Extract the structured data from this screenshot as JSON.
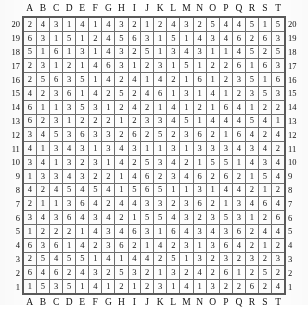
{
  "table": {
    "type": "grid",
    "description": "20 by 20 numeric lookup grid with letter column headers A-T repeated top and bottom, and row numbers 20 down to 1 repeated on left and right edges.",
    "column_headers": [
      "A",
      "B",
      "C",
      "D",
      "E",
      "F",
      "G",
      "H",
      "I",
      "J",
      "K",
      "L",
      "M",
      "N",
      "O",
      "P",
      "Q",
      "R",
      "S",
      "T"
    ],
    "row_labels": [
      "20",
      "19",
      "18",
      "17",
      "16",
      "15",
      "14",
      "13",
      "12",
      "11",
      "10",
      "9",
      "8",
      "7",
      "6",
      "5",
      "4",
      "3",
      "2",
      "1"
    ],
    "value_range": [
      1,
      6
    ],
    "rows": [
      {
        "label": "20",
        "values": [
          2,
          4,
          3,
          1,
          4,
          1,
          4,
          3,
          2,
          1,
          2,
          4,
          3,
          2,
          5,
          4,
          4,
          5,
          1,
          5
        ]
      },
      {
        "label": "19",
        "values": [
          6,
          3,
          1,
          5,
          1,
          2,
          4,
          5,
          6,
          3,
          1,
          5,
          1,
          4,
          3,
          4,
          6,
          2,
          6,
          3
        ]
      },
      {
        "label": "18",
        "values": [
          5,
          1,
          6,
          1,
          3,
          1,
          4,
          3,
          2,
          5,
          1,
          3,
          4,
          3,
          1,
          1,
          4,
          5,
          2,
          5
        ]
      },
      {
        "label": "17",
        "values": [
          2,
          3,
          1,
          2,
          1,
          4,
          6,
          3,
          1,
          2,
          3,
          1,
          5,
          1,
          2,
          2,
          6,
          1,
          6,
          3
        ]
      },
      {
        "label": "16",
        "values": [
          2,
          5,
          6,
          3,
          5,
          1,
          4,
          2,
          4,
          1,
          4,
          2,
          1,
          6,
          1,
          2,
          3,
          5,
          1,
          6
        ]
      },
      {
        "label": "15",
        "values": [
          4,
          2,
          3,
          6,
          1,
          4,
          2,
          5,
          2,
          4,
          6,
          1,
          3,
          1,
          4,
          1,
          2,
          3,
          5,
          3
        ]
      },
      {
        "label": "14",
        "values": [
          6,
          1,
          1,
          3,
          5,
          3,
          1,
          2,
          4,
          2,
          1,
          4,
          1,
          2,
          1,
          6,
          4,
          1,
          2,
          2
        ]
      },
      {
        "label": "13",
        "values": [
          6,
          2,
          3,
          1,
          2,
          2,
          2,
          1,
          2,
          3,
          3,
          4,
          5,
          1,
          4,
          4,
          4,
          5,
          4,
          1
        ]
      },
      {
        "label": "12",
        "values": [
          3,
          4,
          5,
          3,
          6,
          3,
          3,
          2,
          6,
          2,
          5,
          2,
          3,
          6,
          2,
          1,
          6,
          4,
          2,
          4
        ]
      },
      {
        "label": "11",
        "values": [
          4,
          1,
          3,
          4,
          3,
          1,
          3,
          4,
          3,
          1,
          1,
          3,
          1,
          3,
          3,
          3,
          4,
          3,
          4,
          2
        ]
      },
      {
        "label": "10",
        "values": [
          3,
          4,
          1,
          3,
          2,
          3,
          1,
          4,
          2,
          5,
          3,
          4,
          2,
          1,
          5,
          5,
          1,
          4,
          3,
          4
        ]
      },
      {
        "label": "9",
        "values": [
          1,
          3,
          3,
          4,
          3,
          2,
          2,
          1,
          4,
          6,
          2,
          3,
          4,
          6,
          2,
          6,
          2,
          1,
          5,
          4
        ]
      },
      {
        "label": "8",
        "values": [
          4,
          2,
          4,
          5,
          4,
          5,
          4,
          1,
          5,
          6,
          5,
          1,
          1,
          3,
          1,
          4,
          4,
          2,
          1,
          2
        ]
      },
      {
        "label": "7",
        "values": [
          2,
          1,
          1,
          3,
          6,
          4,
          2,
          4,
          4,
          3,
          3,
          2,
          3,
          6,
          2,
          1,
          3,
          4,
          6,
          4
        ]
      },
      {
        "label": "6",
        "values": [
          3,
          4,
          3,
          6,
          4,
          3,
          4,
          2,
          1,
          5,
          5,
          4,
          3,
          2,
          3,
          5,
          3,
          1,
          2,
          6
        ]
      },
      {
        "label": "5",
        "values": [
          1,
          2,
          2,
          2,
          1,
          4,
          3,
          4,
          6,
          3,
          1,
          6,
          4,
          3,
          4,
          3,
          6,
          2,
          4,
          4
        ]
      },
      {
        "label": "4",
        "values": [
          6,
          3,
          6,
          1,
          4,
          2,
          3,
          6,
          2,
          1,
          4,
          2,
          3,
          1,
          3,
          6,
          4,
          2,
          1,
          2
        ]
      },
      {
        "label": "3",
        "values": [
          2,
          5,
          4,
          5,
          5,
          1,
          4,
          1,
          4,
          4,
          2,
          5,
          1,
          3,
          2,
          3,
          2,
          3,
          2,
          3
        ]
      },
      {
        "label": "2",
        "values": [
          6,
          4,
          6,
          2,
          4,
          3,
          2,
          5,
          3,
          2,
          1,
          3,
          2,
          4,
          2,
          6,
          1,
          2,
          5,
          2
        ]
      },
      {
        "label": "1",
        "values": [
          1,
          5,
          3,
          5,
          1,
          4,
          1,
          2,
          1,
          2,
          3,
          1,
          4,
          1,
          3,
          2,
          2,
          6,
          2,
          4
        ]
      }
    ]
  }
}
